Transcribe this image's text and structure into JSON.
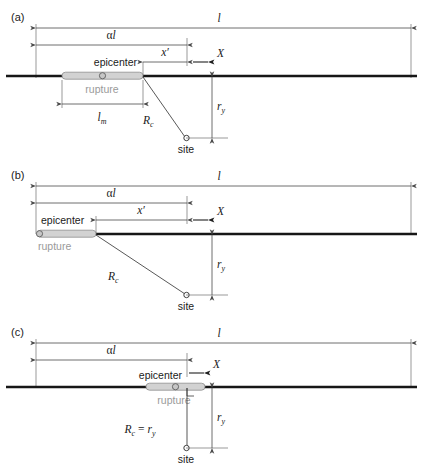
{
  "figure": {
    "width": 421,
    "height": 472,
    "background": "#ffffff",
    "colors": {
      "fault_line": "#171717",
      "dimension_line": "#4a4a4a",
      "rupture_fill": "#d2d2d2",
      "rupture_stroke": "#8d8d8d",
      "rupture_label": "#9a9a9a",
      "text": "#1a1a1a",
      "site_marker_fill": "#ffffff"
    }
  },
  "panels": [
    {
      "id": "a",
      "label": "(a)",
      "labels": {
        "total_length": "l",
        "alpha_length": "αl",
        "x_prime": "x′",
        "axis_x": "X",
        "epicenter": "epicenter",
        "rupture": "rupture",
        "rupture_length": "l",
        "rupture_length_sub": "m",
        "distance_rc": "R",
        "distance_rc_sub": "c",
        "distance_ry": "r",
        "distance_ry_sub": "y",
        "site": "site"
      }
    },
    {
      "id": "b",
      "label": "(b)",
      "labels": {
        "total_length": "l",
        "alpha_length": "αl",
        "x_prime": "x′",
        "axis_x": "X",
        "epicenter": "epicenter",
        "rupture": "rupture",
        "distance_rc": "R",
        "distance_rc_sub": "c",
        "distance_ry": "r",
        "distance_ry_sub": "y",
        "site": "site"
      }
    },
    {
      "id": "c",
      "label": "(c)",
      "labels": {
        "total_length": "l",
        "alpha_length": "αl",
        "axis_x": "X",
        "epicenter": "epicenter",
        "rupture": "rupture",
        "distance_rc_eq": "R",
        "distance_rc_eq_sub": "c",
        "distance_rc_eq_mid": " = ",
        "distance_rc_eq_r": "r",
        "distance_rc_eq_rsub": "y",
        "distance_ry": "r",
        "distance_ry_sub": "y",
        "site": "site"
      }
    }
  ]
}
